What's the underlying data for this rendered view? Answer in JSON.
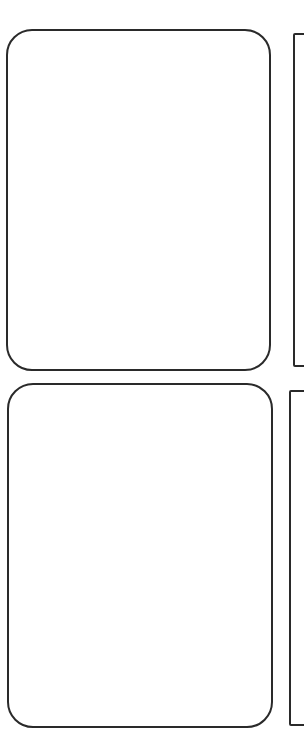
{
  "sketch": {
    "description": "Four hand-drawn blank card outlines arranged in a 2x2 grid; right column partially cropped",
    "stroke_color": "#2a2a2a",
    "background_color": "#ffffff",
    "cards": [
      {
        "position": "top-left",
        "shape": "rounded-rectangle",
        "content": ""
      },
      {
        "position": "top-right",
        "shape": "rectangle",
        "content": "",
        "cropped": true
      },
      {
        "position": "bottom-left",
        "shape": "rounded-rectangle",
        "content": ""
      },
      {
        "position": "bottom-right",
        "shape": "rectangle",
        "content": "",
        "cropped": true
      }
    ]
  }
}
